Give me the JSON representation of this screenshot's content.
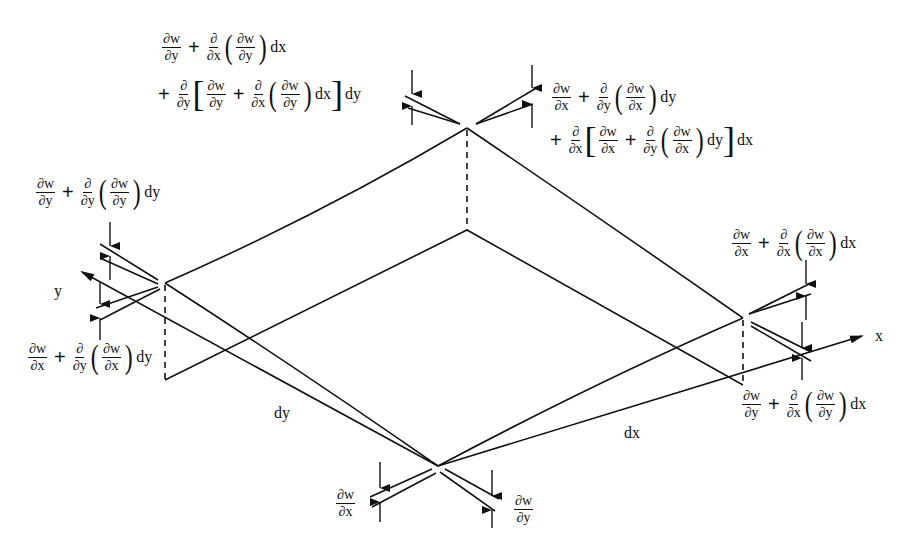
{
  "diagram": {
    "axes": {
      "x_label": "x",
      "y_label": "y"
    },
    "edge_labels": {
      "dy": "dy",
      "dx": "dx"
    },
    "partial": "∂",
    "w": "w",
    "x": "x",
    "y": "y",
    "plus": "+",
    "dx": "dx",
    "dy": "dy",
    "lparen": "(",
    "rparen": ")",
    "lbracket": "[",
    "rbracket": "]",
    "labels": {
      "bottom_left": "∂w/∂x",
      "bottom_right": "∂w/∂y",
      "left_top": "∂w/∂y + ∂/∂y(∂w/∂y) dy",
      "left_bottom": "∂w/∂x + ∂/∂y(∂w/∂x) dy",
      "right_top": "∂w/∂x + ∂/∂x(∂w/∂x) dx",
      "right_bottom": "∂w/∂y + ∂/∂x(∂w/∂y) dx",
      "top_left_line1": "∂w/∂y + ∂/∂x(∂w/∂y) dx",
      "top_left_line2": "+ ∂/∂y[∂w/∂y + ∂/∂x(∂w/∂y) dx] dy",
      "top_right_line1": "∂w/∂x + ∂/∂y(∂w/∂x) dy",
      "top_right_line2": "+ ∂/∂x[∂w/∂x + ∂/∂y(∂w/∂x) dy] dx"
    },
    "colors": {
      "line": "#111111",
      "background": "#ffffff"
    }
  }
}
